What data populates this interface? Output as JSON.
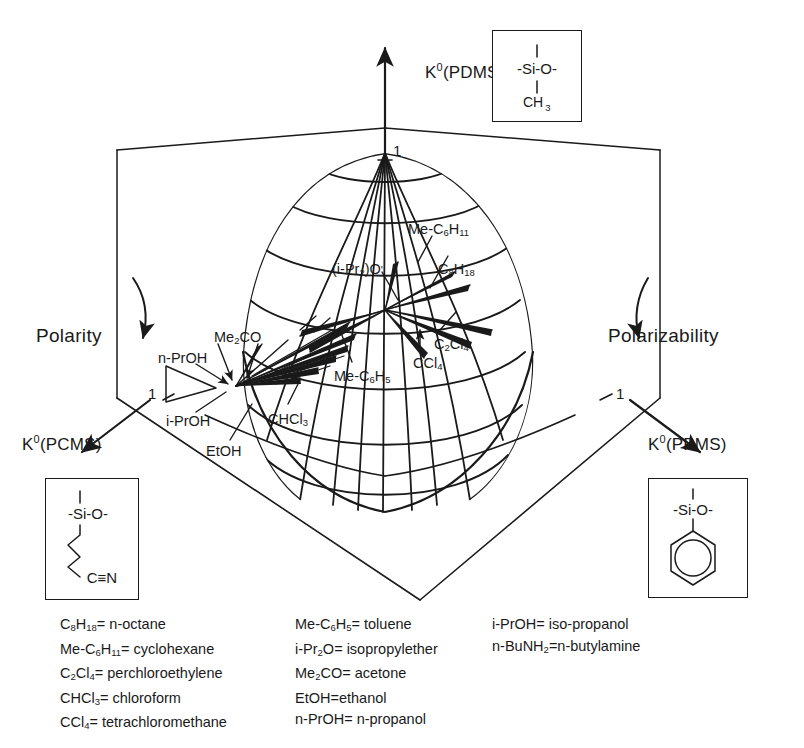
{
  "figure": {
    "type": "3d-solubility-sphere"
  },
  "axes": {
    "vertical": {
      "label_k": "K",
      "label_sup": "0",
      "label_paren": "(PDMS)",
      "full": "K0(PDMS)",
      "tick": "1"
    },
    "left": {
      "label_k": "K",
      "label_sup": "0",
      "label_paren": "(PCMS)",
      "full": "K0(PCMS)",
      "tick": "1"
    },
    "right": {
      "label_k": "K",
      "label_sup": "0",
      "label_paren": "(PPMS)",
      "full": "K0(PPMS)",
      "tick": "1"
    }
  },
  "directions": {
    "left": "Polarity",
    "right": "Polarizability"
  },
  "structures": {
    "pdms": {
      "name": "PDMS",
      "backbone": "-Si-O-",
      "substituent": "CH",
      "substituent_sub": "3",
      "kind": "methyl"
    },
    "pcms": {
      "name": "PCMS",
      "backbone": "-Si-O-",
      "substituent": "C",
      "terminal": "N",
      "bond": "≡",
      "kind": "cyanopropyl-chain"
    },
    "ppms": {
      "name": "PPMS",
      "backbone": "-Si-O-",
      "substituent": "",
      "kind": "phenyl-ring"
    }
  },
  "species": [
    {
      "id": "me-c6h11",
      "base": "Me-C",
      "sub1": "6",
      "mid": "H",
      "sub2": "11",
      "tail": "",
      "x": 408,
      "y": 222
    },
    {
      "id": "ipr2o",
      "base": "(i-Pr",
      "sub1": "2",
      "mid": ")O",
      "sub2": "",
      "tail": "",
      "x": 332,
      "y": 262
    },
    {
      "id": "c8h18",
      "base": "C",
      "sub1": "8",
      "mid": "H",
      "sub2": "18",
      "tail": "",
      "x": 438,
      "y": 262
    },
    {
      "id": "me2co",
      "base": "Me",
      "sub1": "2",
      "mid": "CO",
      "sub2": "",
      "tail": "",
      "x": 214,
      "y": 330
    },
    {
      "id": "n-proh",
      "base": "n-PrOH",
      "sub1": "",
      "mid": "",
      "sub2": "",
      "tail": "",
      "x": 158,
      "y": 351
    },
    {
      "id": "me-c6h5",
      "base": "Me-C",
      "sub1": "6",
      "mid": "H",
      "sub2": "5",
      "tail": "",
      "x": 334,
      "y": 369
    },
    {
      "id": "ccl4",
      "base": "CCl",
      "sub1": "4",
      "mid": "",
      "sub2": "",
      "tail": "",
      "x": 413,
      "y": 356
    },
    {
      "id": "c2cl4",
      "base": "C",
      "sub1": "2",
      "mid": "Cl",
      "sub2": "4",
      "tail": "",
      "x": 434,
      "y": 337
    },
    {
      "id": "i-proh",
      "base": "i-PrOH",
      "sub1": "",
      "mid": "",
      "sub2": "",
      "tail": "",
      "x": 166,
      "y": 414
    },
    {
      "id": "chcl3",
      "base": "CHCl",
      "sub1": "3",
      "mid": "",
      "sub2": "",
      "tail": "",
      "x": 268,
      "y": 412
    },
    {
      "id": "etoh",
      "base": "EtOH",
      "sub1": "",
      "mid": "",
      "sub2": "",
      "tail": "",
      "x": 206,
      "y": 444
    }
  ],
  "legend": {
    "columns": [
      {
        "x": 60,
        "rows": [
          {
            "parts": [
              [
                "C",
                ""
              ],
              [
                "",
                ""
              ],
              [
                "8",
                "sub"
              ],
              [
                "H",
                ""
              ],
              [
                "18",
                "sub"
              ],
              [
                "= n-octane",
                ""
              ]
            ]
          },
          {
            "parts": [
              [
                "Me-C",
                ""
              ],
              [
                "6",
                "sub"
              ],
              [
                "H",
                ""
              ],
              [
                "11",
                "sub"
              ],
              [
                "= cyclohexane",
                ""
              ]
            ]
          },
          {
            "parts": [
              [
                "C",
                ""
              ],
              [
                "2",
                "sub"
              ],
              [
                "Cl",
                ""
              ],
              [
                "4",
                "sub"
              ],
              [
                "= perchloroethylene",
                ""
              ]
            ]
          },
          {
            "parts": [
              [
                "CHCl",
                ""
              ],
              [
                "3",
                "sub"
              ],
              [
                "= chloroform",
                ""
              ]
            ]
          },
          {
            "parts": [
              [
                "CCl",
                ""
              ],
              [
                "4",
                "sub"
              ],
              [
                "= tetrachloromethane",
                ""
              ]
            ]
          }
        ]
      },
      {
        "x": 295,
        "rows": [
          {
            "parts": [
              [
                "Me-C",
                ""
              ],
              [
                "6",
                "sub"
              ],
              [
                "H",
                ""
              ],
              [
                "5",
                "sub"
              ],
              [
                "= toluene",
                ""
              ]
            ]
          },
          {
            "parts": [
              [
                "i-Pr",
                ""
              ],
              [
                "2",
                "sub"
              ],
              [
                "O= isopropylether",
                ""
              ]
            ]
          },
          {
            "parts": [
              [
                "Me",
                ""
              ],
              [
                "2",
                "sub"
              ],
              [
                "CO= acetone",
                ""
              ]
            ]
          },
          {
            "parts": [
              [
                "EtOH=ethanol",
                ""
              ]
            ]
          },
          {
            "parts": [
              [
                "n-PrOH= n-propanol",
                ""
              ]
            ]
          }
        ]
      },
      {
        "x": 492,
        "rows": [
          {
            "parts": [
              [
                "i-PrOH= iso-propanol",
                ""
              ]
            ]
          },
          {
            "parts": [
              [
                "n-BuNH",
                ""
              ],
              [
                "2",
                "sub"
              ],
              [
                "=n-butylamine",
                ""
              ]
            ]
          }
        ]
      }
    ],
    "entries": [
      {
        "formula": "C8H18",
        "meaning": "n-octane"
      },
      {
        "formula": "Me-C6H11",
        "meaning": "cyclohexane"
      },
      {
        "formula": "C2Cl4",
        "meaning": "perchloroethylene"
      },
      {
        "formula": "CHCl3",
        "meaning": "chloroform"
      },
      {
        "formula": "CCl4",
        "meaning": "tetrachloromethane"
      },
      {
        "formula": "Me-C6H5",
        "meaning": "toluene"
      },
      {
        "formula": "i-Pr2O",
        "meaning": "isopropylether"
      },
      {
        "formula": "Me2CO",
        "meaning": "acetone"
      },
      {
        "formula": "EtOH",
        "meaning": "ethanol"
      },
      {
        "formula": "n-PrOH",
        "meaning": "n-propanol"
      },
      {
        "formula": "i-PrOH",
        "meaning": "iso-propanol"
      },
      {
        "formula": "n-BuNH2",
        "meaning": "n-butylamine"
      }
    ]
  },
  "colors": {
    "ink": "#1a1a1a",
    "paper": "#ffffff"
  }
}
